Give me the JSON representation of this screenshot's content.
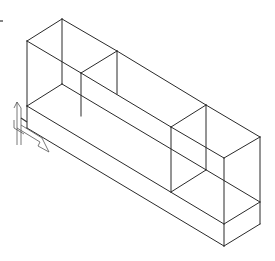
{
  "drawing": {
    "type": "isometric-wireframe",
    "description": "Base slab with two rectangular boxes on top, joined by a long bar",
    "line_color": "#2a2a2a",
    "background": "#ffffff",
    "edges": [
      [
        27,
        41,
        62,
        19
      ],
      [
        62,
        19,
        117,
        51
      ],
      [
        27,
        41,
        81,
        73
      ],
      [
        81,
        73,
        117,
        51
      ],
      [
        27,
        41,
        27,
        106
      ],
      [
        62,
        19,
        62,
        84
      ],
      [
        81,
        73,
        81,
        116
      ],
      [
        117,
        51,
        206,
        105
      ],
      [
        81,
        73,
        171,
        127
      ],
      [
        171,
        127,
        206,
        105
      ],
      [
        117,
        51,
        117,
        94
      ],
      [
        171,
        127,
        171,
        192
      ],
      [
        206,
        105,
        206,
        170
      ],
      [
        206,
        105,
        260,
        137
      ],
      [
        171,
        127,
        224,
        158
      ],
      [
        224,
        158,
        260,
        137
      ],
      [
        224,
        158,
        224,
        246
      ],
      [
        260,
        137,
        260,
        224
      ],
      [
        62,
        84,
        260,
        202
      ],
      [
        27,
        106,
        224,
        224
      ],
      [
        27,
        106,
        62,
        84
      ],
      [
        27,
        106,
        27,
        128
      ],
      [
        27,
        128,
        224,
        246
      ],
      [
        171,
        192,
        206,
        170
      ],
      [
        224,
        224,
        260,
        202
      ],
      [
        224,
        246,
        260,
        224
      ]
    ]
  },
  "ucs_icon": {
    "name": "UCS icon",
    "origin": [
      24,
      126
    ],
    "axes": [
      "Y",
      "X"
    ]
  },
  "crosshair_mark": {
    "x": 0,
    "y": 21,
    "length": 3
  }
}
